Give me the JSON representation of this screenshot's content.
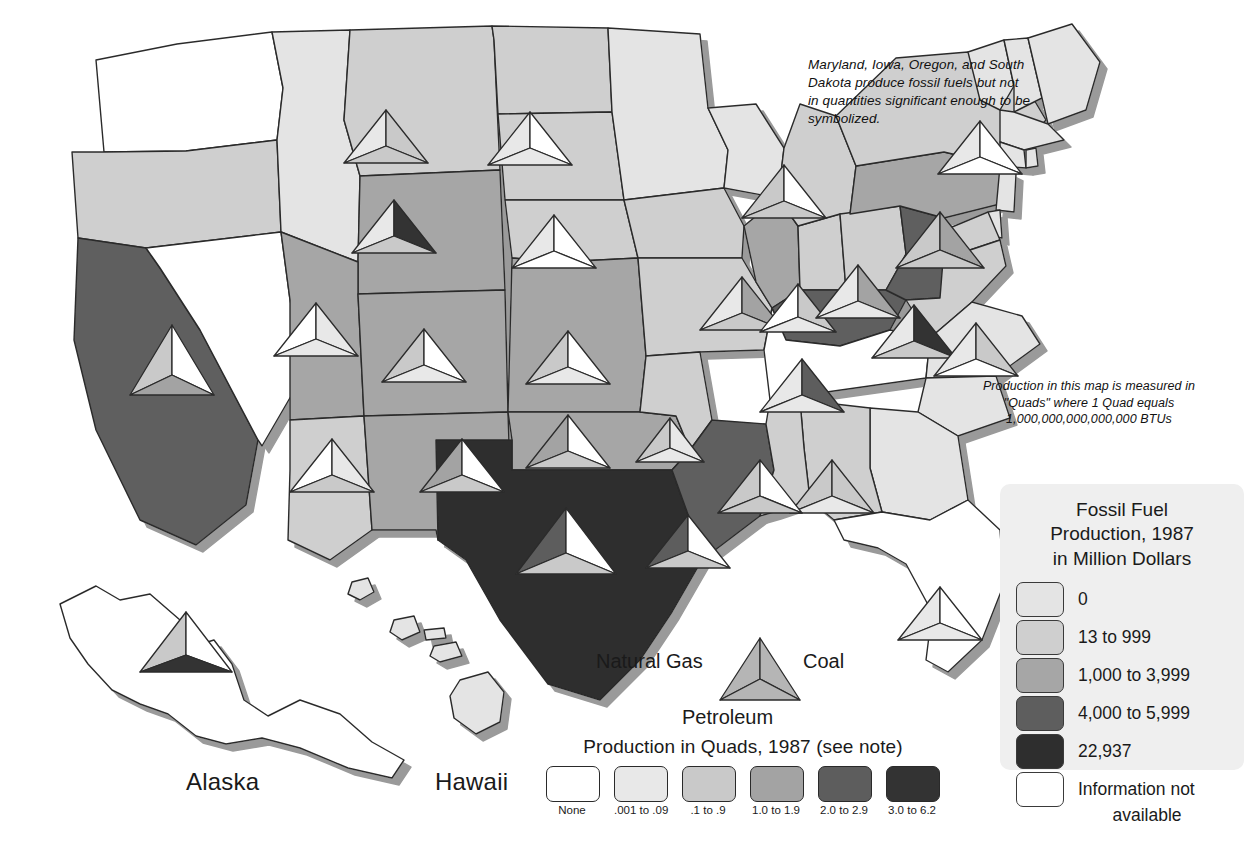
{
  "map": {
    "title_implied": "Fossil Fuel Production, 1987",
    "notes": {
      "small_producers": "Maryland, Iowa, Oregon, and South Dakota produce fossil fuels but not in quantities significant enough to be symbolized.",
      "quad_definition": "Production in this map is measured in \"Quads\" where 1 Quad equals 1,000,000,000,000,000 BTUs"
    },
    "insets": [
      {
        "name": "alaska",
        "label": "Alaska"
      },
      {
        "name": "hawaii",
        "label": "Hawaii"
      }
    ]
  },
  "fuel_key": {
    "natural_gas_label": "Natural Gas",
    "coal_label": "Coal",
    "petroleum_label": "Petroleum",
    "symbol_fill": "#b5b5b5"
  },
  "quads_legend": {
    "title": "Production in Quads, 1987 (see note)",
    "classes": [
      {
        "label": "None",
        "color": "#ffffff"
      },
      {
        "label": ".001 to .09",
        "color": "#e8e8e8"
      },
      {
        "label": ".1 to .9",
        "color": "#c9c9c9"
      },
      {
        "label": "1.0 to 1.9",
        "color": "#a3a3a3"
      },
      {
        "label": "2.0 to 2.9",
        "color": "#5d5d5d"
      },
      {
        "label": "3.0 to 6.2",
        "color": "#333333"
      }
    ]
  },
  "value_legend": {
    "title": "Fossil Fuel Production, 1987 in Million Dollars",
    "title_lines": [
      "Fossil Fuel",
      "Production, 1987",
      "in Million Dollars"
    ],
    "panel_color": "#efefef",
    "classes": [
      {
        "label": "0",
        "color": "#e4e4e4"
      },
      {
        "label": "13 to 999",
        "color": "#cfcfcf"
      },
      {
        "label": "1,000 to 3,999",
        "color": "#a6a6a6"
      },
      {
        "label": "4,000 to 5,999",
        "color": "#5e5e5e"
      },
      {
        "label": "22,937",
        "color": "#2e2e2e"
      }
    ],
    "no_data": {
      "label_line1": "Information not",
      "label_line2": "available",
      "color": "#ffffff"
    }
  },
  "chart_data": {
    "type": "map",
    "title": "Fossil Fuel Production, 1987 in Million Dollars",
    "value_classes": [
      "0",
      "13 to 999",
      "1,000 to 3,999",
      "4,000 to 5,999",
      "22,937",
      "Information not available"
    ],
    "quad_classes": [
      "None",
      ".001 to .09",
      ".1 to .9",
      "1.0 to 1.9",
      "2.0 to 2.9",
      "3.0 to 6.2"
    ],
    "fuels": [
      "Natural Gas",
      "Coal",
      "Petroleum"
    ],
    "states": [
      {
        "name": "Washington",
        "value_class": "Information not available",
        "gas": null,
        "coal": null,
        "petroleum": null
      },
      {
        "name": "Oregon",
        "value_class": "13 to 999",
        "gas": null,
        "coal": null,
        "petroleum": null
      },
      {
        "name": "California",
        "value_class": "4,000 to 5,999",
        "gas": ".1 to .9",
        "coal": "None",
        "petroleum": "1.0 to 1.9"
      },
      {
        "name": "Nevada",
        "value_class": "Information not available",
        "gas": null,
        "coal": null,
        "petroleum": null
      },
      {
        "name": "Idaho",
        "value_class": "13 to 999",
        "gas": null,
        "coal": null,
        "petroleum": null
      },
      {
        "name": "Montana",
        "value_class": "13 to 999",
        "gas": ".001 to .09",
        "coal": ".1 to .9",
        "petroleum": ".1 to .9"
      },
      {
        "name": "Wyoming",
        "value_class": "1,000 to 3,999",
        "gas": ".1 to .9",
        "coal": "3.0 to 6.2",
        "petroleum": ".1 to .9"
      },
      {
        "name": "Utah",
        "value_class": "1,000 to 3,999",
        "gas": ".001 to .09",
        "coal": ".1 to .9",
        "petroleum": ".001 to .09"
      },
      {
        "name": "Colorado",
        "value_class": "1,000 to 3,999",
        "gas": ".1 to .9",
        "coal": ".1 to .9",
        "petroleum": ".001 to .09"
      },
      {
        "name": "Arizona",
        "value_class": "13 to 999",
        "gas": "None",
        "coal": ".1 to .9",
        "petroleum": "None"
      },
      {
        "name": "New Mexico",
        "value_class": "1,000 to 3,999",
        "gas": "1.0 to 1.9",
        "coal": ".1 to .9",
        "petroleum": ".1 to .9"
      },
      {
        "name": "North Dakota",
        "value_class": "13 to 999",
        "gas": ".001 to .09",
        "coal": ".1 to .9",
        "petroleum": ".1 to .9"
      },
      {
        "name": "South Dakota",
        "value_class": "13 to 999",
        "gas": null,
        "coal": null,
        "petroleum": null
      },
      {
        "name": "Nebraska",
        "value_class": "13 to 999",
        "gas": "None",
        "coal": "None",
        "petroleum": ".001 to .09"
      },
      {
        "name": "Kansas",
        "value_class": "1,000 to 3,999",
        "gas": ".1 to .9",
        "coal": ".001 to .09",
        "petroleum": ".1 to .9"
      },
      {
        "name": "Oklahoma",
        "value_class": "1,000 to 3,999",
        "gas": "1.0 to 1.9",
        "coal": ".001 to .09",
        "petroleum": ".1 to .9"
      },
      {
        "name": "Texas",
        "value_class": "22,937",
        "gas": "3.0 to 6.2",
        "coal": ".1 to .9",
        "petroleum": "2.0 to 2.9"
      },
      {
        "name": "Minnesota",
        "value_class": "0",
        "gas": null,
        "coal": null,
        "petroleum": null
      },
      {
        "name": "Iowa",
        "value_class": "13 to 999",
        "gas": null,
        "coal": null,
        "petroleum": null
      },
      {
        "name": "Missouri",
        "value_class": "13 to 999",
        "gas": "None",
        "coal": ".001 to .09",
        "petroleum": "None"
      },
      {
        "name": "Arkansas",
        "value_class": "13 to 999",
        "gas": ".1 to .9",
        "coal": ".001 to .09",
        "petroleum": ".001 to .09"
      },
      {
        "name": "Louisiana",
        "value_class": "4,000 to 5,999",
        "gas": "3.0 to 6.2",
        "coal": ".001 to .09",
        "petroleum": ".1 to .9"
      },
      {
        "name": "Wisconsin",
        "value_class": "0",
        "gas": null,
        "coal": null,
        "petroleum": null
      },
      {
        "name": "Illinois",
        "value_class": "1,000 to 3,999",
        "gas": ".001 to .09",
        "coal": "1.0 to 1.9",
        "petroleum": ".1 to .9"
      },
      {
        "name": "Indiana",
        "value_class": "13 to 999",
        "gas": ".001 to .09",
        "coal": ".1 to .9",
        "petroleum": ".001 to .09"
      },
      {
        "name": "Michigan",
        "value_class": "13 to 999",
        "gas": ".1 to .9",
        "coal": "None",
        "petroleum": ".1 to .9"
      },
      {
        "name": "Ohio",
        "value_class": "13 to 999",
        "gas": ".001 to .09",
        "coal": "1.0 to 1.9",
        "petroleum": ".001 to .09"
      },
      {
        "name": "Kentucky",
        "value_class": "4,000 to 5,999",
        "gas": ".001 to .09",
        "coal": "3.0 to 6.2",
        "petroleum": ".001 to .09"
      },
      {
        "name": "Tennessee",
        "value_class": "Information not available",
        "gas": null,
        "coal": null,
        "petroleum": null
      },
      {
        "name": "West Virginia",
        "value_class": "4,000 to 5,999",
        "gas": ".1 to .9",
        "coal": "3.0 to 6.2",
        "petroleum": ".001 to .09"
      },
      {
        "name": "Pennsylvania",
        "value_class": "1,000 to 3,999",
        "gas": ".1 to .9",
        "coal": "1.0 to 1.9",
        "petroleum": ".001 to .09"
      },
      {
        "name": "New York",
        "value_class": "13 to 999",
        "gas": ".001 to .09",
        "coal": "None",
        "petroleum": ".001 to .09"
      },
      {
        "name": "Virginia",
        "value_class": "13 to 999",
        "gas": ".001 to .09",
        "coal": ".1 to .9",
        "petroleum": "None"
      },
      {
        "name": "Maryland",
        "value_class": "13 to 999",
        "gas": null,
        "coal": null,
        "petroleum": null
      },
      {
        "name": "North Carolina",
        "value_class": "0",
        "gas": null,
        "coal": null,
        "petroleum": null
      },
      {
        "name": "South Carolina",
        "value_class": "0",
        "gas": null,
        "coal": null,
        "petroleum": null
      },
      {
        "name": "Georgia",
        "value_class": "0",
        "gas": null,
        "coal": null,
        "petroleum": null
      },
      {
        "name": "Alabama",
        "value_class": "13 to 999",
        "gas": ".1 to .9",
        "coal": ".1 to .9",
        "petroleum": ".001 to .09"
      },
      {
        "name": "Mississippi",
        "value_class": "13 to 999",
        "gas": ".1 to .9",
        "coal": "None",
        "petroleum": ".1 to .9"
      },
      {
        "name": "Florida",
        "value_class": "Information not available",
        "gas": ".001 to .09",
        "coal": "None",
        "petroleum": ".001 to .09"
      },
      {
        "name": "Alaska",
        "value_class": "Information not available",
        "gas": ".1 to .9",
        "coal": ".001 to .09",
        "petroleum": "3.0 to 6.2"
      },
      {
        "name": "Hawaii",
        "value_class": "0",
        "gas": null,
        "coal": null,
        "petroleum": null
      }
    ]
  }
}
